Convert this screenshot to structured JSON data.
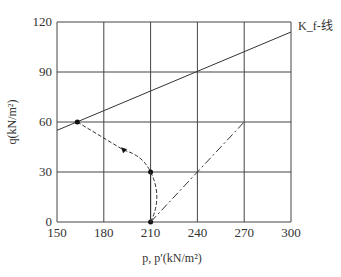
{
  "chart_data": {
    "type": "line",
    "title": "",
    "xlabel": "p, p′(kN/m²)",
    "ylabel": "q(kN/m²)",
    "xlim": [
      150,
      300
    ],
    "ylim": [
      0,
      120
    ],
    "xticks": [
      150,
      180,
      210,
      240,
      270,
      300
    ],
    "yticks": [
      0,
      30,
      60,
      90,
      120
    ],
    "grid": true,
    "annotations": [
      {
        "text": "K_f-线",
        "near": "top-right end of failure line"
      }
    ],
    "series": [
      {
        "name": "Kf failure line",
        "style": "solid",
        "x": [
          150,
          300
        ],
        "y": [
          55,
          114
        ]
      },
      {
        "name": "effective stress path",
        "style": "dashed",
        "x": [
          210,
          215,
          210,
          193,
          163
        ],
        "y": [
          0,
          15,
          30,
          43,
          60
        ],
        "markers": [
          [
            210,
            0
          ],
          [
            210,
            30
          ],
          [
            163,
            60
          ]
        ],
        "arrow_at": [
          193,
          43
        ]
      },
      {
        "name": "total stress path (vertical)",
        "style": "solid",
        "x": [
          210,
          210
        ],
        "y": [
          0,
          30
        ]
      },
      {
        "name": "total stress path",
        "style": "dash-dot",
        "x": [
          210,
          270
        ],
        "y": [
          0,
          60
        ]
      }
    ]
  }
}
